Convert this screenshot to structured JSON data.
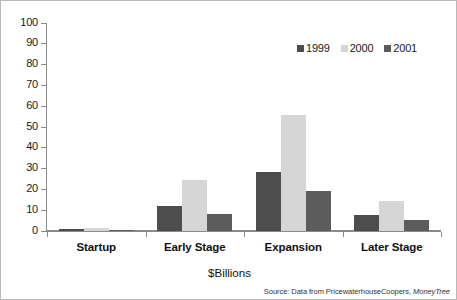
{
  "chart_data": {
    "type": "bar",
    "title": "",
    "subtitle": "",
    "xlabel": "$Billions",
    "ylabel": "",
    "ylim": [
      0,
      100
    ],
    "ytick_step": 10,
    "yticks": [
      100,
      90,
      80,
      70,
      60,
      50,
      40,
      30,
      20,
      10,
      0
    ],
    "grid": false,
    "legend_position": "top-right",
    "categories": [
      "Startup",
      "Early Stage",
      "Expansion",
      "Later Stage"
    ],
    "series": [
      {
        "name": "1999",
        "color": "#4d4d4d",
        "values": [
          1.0,
          12.2,
          28.6,
          7.8
        ]
      },
      {
        "name": "2000",
        "color": "#d6d6d6",
        "values": [
          1.3,
          24.6,
          56.0,
          14.3
        ]
      },
      {
        "name": "2001",
        "color": "#5c5c5c",
        "values": [
          0.4,
          8.2,
          19.0,
          5.5
        ]
      }
    ],
    "annotations": {
      "source": {
        "prefix": "Source: Data from PricewaterhouseCoopers, ",
        "italic_part": "MoneyTree"
      }
    },
    "colors": {
      "axis": "#8a8a8a",
      "text": "#111111",
      "background": "#ffffff",
      "border": "#b9b9b9"
    }
  }
}
